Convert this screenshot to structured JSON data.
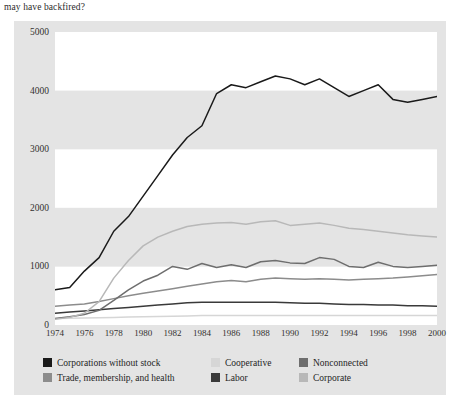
{
  "caption": "may have backfired?",
  "chart_data": {
    "type": "line",
    "title": "",
    "xlabel": "",
    "ylabel": "",
    "xlim": [
      1974,
      2000
    ],
    "ylim": [
      0,
      5000
    ],
    "ytick_step": 1000,
    "grid": "alternating horizontal bands every 1000 units",
    "legend_position": "below plot, 3 columns x 2 rows",
    "yticks": [
      "0",
      "1000",
      "2000",
      "3000",
      "4000",
      "5000"
    ],
    "categories": [
      "1974",
      "1975",
      "1976",
      "1977",
      "1978",
      "1979",
      "1980",
      "1981",
      "1982",
      "1983",
      "1984",
      "1985",
      "1986",
      "1987",
      "1988",
      "1989",
      "1990",
      "1991",
      "1992",
      "1993",
      "1994",
      "1995",
      "1996",
      "1997",
      "1998",
      "1999",
      "2000"
    ],
    "xticks": [
      "1974",
      "1976",
      "1978",
      "1980",
      "1982",
      "1984",
      "1986",
      "1988",
      "1990",
      "1992",
      "1994",
      "1996",
      "1998",
      "2000"
    ],
    "series": [
      {
        "name": "Corporations without stock",
        "color": "#1a1a1a",
        "values": [
          600,
          640,
          920,
          1150,
          1600,
          1850,
          2200,
          2550,
          2900,
          3200,
          3400,
          3950,
          4100,
          4050,
          4150,
          4250,
          4200,
          4100,
          4200,
          4050,
          3900,
          4000,
          4100,
          3850,
          3800,
          3850,
          3900
        ]
      },
      {
        "name": "Trade, membership, and health",
        "color": "#8c8c8c",
        "values": [
          320,
          340,
          360,
          400,
          450,
          500,
          540,
          580,
          620,
          660,
          700,
          740,
          760,
          740,
          780,
          800,
          790,
          780,
          790,
          780,
          770,
          780,
          790,
          800,
          820,
          840,
          860
        ]
      },
      {
        "name": "Cooperative",
        "color": "#d6d6d6",
        "values": [
          110,
          115,
          120,
          125,
          130,
          135,
          140,
          145,
          150,
          155,
          160,
          160,
          160,
          160,
          160,
          160,
          160,
          160,
          160,
          160,
          160,
          160,
          160,
          160,
          160,
          160,
          160
        ]
      },
      {
        "name": "Labor",
        "color": "#3a3a3a",
        "values": [
          200,
          220,
          240,
          260,
          280,
          300,
          320,
          340,
          360,
          380,
          390,
          390,
          390,
          390,
          390,
          390,
          380,
          370,
          370,
          360,
          350,
          350,
          340,
          340,
          330,
          330,
          320
        ]
      },
      {
        "name": "Nonconnected",
        "color": "#6e6e6e",
        "values": [
          110,
          140,
          180,
          250,
          420,
          600,
          750,
          850,
          1000,
          950,
          1050,
          980,
          1030,
          980,
          1080,
          1100,
          1060,
          1050,
          1150,
          1120,
          1000,
          980,
          1070,
          1000,
          980,
          1000,
          1020
        ]
      },
      {
        "name": "Corporate",
        "color": "#b8b8b8",
        "values": [
          100,
          130,
          200,
          400,
          800,
          1100,
          1350,
          1500,
          1600,
          1680,
          1720,
          1740,
          1750,
          1720,
          1760,
          1780,
          1700,
          1720,
          1740,
          1700,
          1650,
          1630,
          1600,
          1570,
          1540,
          1520,
          1500
        ]
      }
    ]
  },
  "legend": {
    "items": [
      {
        "label": "Corporations without stock",
        "color": "#1a1a1a",
        "col": 0,
        "row": 0
      },
      {
        "label": "Cooperative",
        "color": "#d6d6d6",
        "col": 1,
        "row": 0
      },
      {
        "label": "Nonconnected",
        "color": "#6e6e6e",
        "col": 2,
        "row": 0
      },
      {
        "label": "Trade, membership, and health",
        "color": "#8c8c8c",
        "col": 0,
        "row": 1
      },
      {
        "label": "Labor",
        "color": "#3a3a3a",
        "col": 1,
        "row": 1
      },
      {
        "label": "Corporate",
        "color": "#b8b8b8",
        "col": 2,
        "row": 1
      }
    ]
  }
}
